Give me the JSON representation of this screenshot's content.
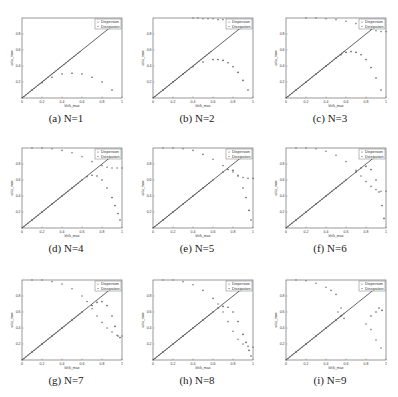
{
  "chart_data": [
    {
      "type": "scatter",
      "caption": "(a) N=1",
      "N": 1,
      "xlabel": "kh/k_max",
      "ylabel": "ω/ω_max",
      "xlim": [
        0,
        1
      ],
      "ylim": [
        0,
        1
      ],
      "xticks": [
        "0",
        "0.2",
        "0.4",
        "0.6",
        "0.8",
        "1"
      ],
      "yticks": [
        "0.2",
        "0.4",
        "0.6",
        "0.8"
      ],
      "legend": [
        "Dispersion",
        "Dissipation"
      ],
      "series": [
        {
          "name": "Exact",
          "x": [
            0,
            0.9
          ],
          "y": [
            0,
            0.9
          ]
        },
        {
          "name": "Dispersion",
          "x": [
            0.1,
            0.2,
            0.3,
            0.4,
            0.5,
            0.6,
            0.7,
            0.8,
            0.9
          ],
          "y": [
            0.1,
            0.19,
            0.26,
            0.3,
            0.31,
            0.3,
            0.26,
            0.2,
            0.1
          ]
        },
        {
          "name": "Dissipation",
          "x": [],
          "y": []
        }
      ]
    },
    {
      "type": "scatter",
      "caption": "(b) N=2",
      "N": 2,
      "xlabel": "kh/k_max",
      "ylabel": "ω/ω_max",
      "xlim": [
        0,
        1
      ],
      "ylim": [
        0,
        1
      ],
      "xticks": [
        "0",
        "0.2",
        "0.4",
        "0.6",
        "0.8",
        "1"
      ],
      "yticks": [
        "0.2",
        "0.4",
        "0.6",
        "0.8"
      ],
      "legend": [
        "Dispersion",
        "Dissipation"
      ],
      "series": [
        {
          "name": "Exact",
          "x": [
            0,
            0.9
          ],
          "y": [
            0,
            0.9
          ]
        },
        {
          "name": "Dispersion",
          "x": [
            0.1,
            0.2,
            0.3,
            0.4,
            0.5,
            0.6,
            0.65,
            0.7,
            0.75,
            0.8,
            0.85,
            0.9,
            0.95
          ],
          "y": [
            0.1,
            0.2,
            0.3,
            0.39,
            0.45,
            0.48,
            0.48,
            0.47,
            0.44,
            0.39,
            0.32,
            0.22,
            0.1
          ]
        },
        {
          "name": "Dissipation",
          "x": [
            0.4,
            0.45,
            0.5,
            0.55,
            0.6,
            0.65,
            0.7,
            0.75,
            0.8,
            0.85,
            0.9,
            0.95
          ],
          "y": [
            1,
            1,
            0.99,
            0.99,
            0.99,
            0.98,
            0.98,
            0.97,
            0.97,
            0.96,
            0.96,
            0.95
          ]
        }
      ]
    },
    {
      "type": "scatter",
      "caption": "(c) N=3",
      "N": 3,
      "xlabel": "kh/k_max",
      "ylabel": "ω/ω_max",
      "xlim": [
        0,
        1
      ],
      "ylim": [
        0,
        1
      ],
      "xticks": [
        "0",
        "0.2",
        "0.4",
        "0.6",
        "0.8",
        "1"
      ],
      "yticks": [
        "0.2",
        "0.4",
        "0.6",
        "0.8"
      ],
      "legend": [
        "Dispersion",
        "Dissipation"
      ],
      "series": [
        {
          "name": "Exact",
          "x": [
            0,
            0.9
          ],
          "y": [
            0,
            0.9
          ]
        },
        {
          "name": "Dispersion",
          "x": [
            0.1,
            0.2,
            0.3,
            0.4,
            0.5,
            0.55,
            0.6,
            0.65,
            0.7,
            0.75,
            0.8,
            0.85,
            0.9,
            0.95
          ],
          "y": [
            0.1,
            0.2,
            0.3,
            0.4,
            0.5,
            0.54,
            0.57,
            0.58,
            0.57,
            0.54,
            0.48,
            0.38,
            0.25,
            0.1
          ]
        },
        {
          "name": "Dissipation",
          "x": [
            0.2,
            0.3,
            0.4,
            0.5,
            0.6,
            0.7,
            0.75,
            0.8,
            0.85,
            0.9,
            0.95,
            1.0
          ],
          "y": [
            1,
            1,
            0.99,
            0.98,
            0.96,
            0.93,
            0.91,
            0.89,
            0.86,
            0.84,
            0.83,
            0.83
          ]
        }
      ]
    },
    {
      "type": "scatter",
      "caption": "(d) N=4",
      "N": 4,
      "xlabel": "kh/k_max",
      "ylabel": "ω/ω_max",
      "xlim": [
        0,
        1
      ],
      "ylim": [
        0,
        1
      ],
      "xticks": [
        "0",
        "0.2",
        "0.4",
        "0.6",
        "0.8",
        "1"
      ],
      "yticks": [
        "0.2",
        "0.4",
        "0.6",
        "0.8"
      ],
      "legend": [
        "Dispersion",
        "Dissipation"
      ],
      "series": [
        {
          "name": "Exact",
          "x": [
            0,
            0.9
          ],
          "y": [
            0,
            0.9
          ]
        },
        {
          "name": "Dispersion",
          "x": [
            0.1,
            0.2,
            0.3,
            0.4,
            0.5,
            0.6,
            0.65,
            0.7,
            0.75,
            0.8,
            0.85,
            0.9,
            0.93,
            0.96,
            0.98
          ],
          "y": [
            0.1,
            0.2,
            0.3,
            0.4,
            0.5,
            0.6,
            0.64,
            0.66,
            0.65,
            0.6,
            0.5,
            0.38,
            0.28,
            0.18,
            0.1
          ]
        },
        {
          "name": "Dissipation",
          "x": [
            0.1,
            0.2,
            0.3,
            0.4,
            0.5,
            0.6,
            0.7,
            0.8,
            0.85,
            0.9,
            0.95,
            1.0
          ],
          "y": [
            1,
            1,
            0.99,
            0.97,
            0.94,
            0.89,
            0.83,
            0.78,
            0.76,
            0.75,
            0.75,
            0.75
          ]
        }
      ]
    },
    {
      "type": "scatter",
      "caption": "(e) N=5",
      "N": 5,
      "xlabel": "kh/k_max",
      "ylabel": "ω/ω_max",
      "xlim": [
        0,
        1
      ],
      "ylim": [
        0,
        1
      ],
      "xticks": [
        "0",
        "0.2",
        "0.4",
        "0.6",
        "0.8",
        "1"
      ],
      "yticks": [
        "0.2",
        "0.4",
        "0.6",
        "0.8"
      ],
      "legend": [
        "Dispersion",
        "Dissipation"
      ],
      "series": [
        {
          "name": "Exact",
          "x": [
            0,
            0.9
          ],
          "y": [
            0,
            0.9
          ]
        },
        {
          "name": "Dispersion",
          "x": [
            0.1,
            0.2,
            0.3,
            0.4,
            0.5,
            0.6,
            0.7,
            0.75,
            0.8,
            0.85,
            0.9,
            0.93,
            0.96,
            0.98
          ],
          "y": [
            0.1,
            0.2,
            0.3,
            0.4,
            0.5,
            0.6,
            0.7,
            0.73,
            0.72,
            0.65,
            0.5,
            0.38,
            0.22,
            0.1
          ]
        },
        {
          "name": "Dissipation",
          "x": [
            0.1,
            0.2,
            0.3,
            0.4,
            0.5,
            0.6,
            0.7,
            0.8,
            0.85,
            0.9,
            0.95,
            1.0
          ],
          "y": [
            1,
            1,
            0.99,
            0.97,
            0.92,
            0.86,
            0.78,
            0.7,
            0.66,
            0.63,
            0.62,
            0.62
          ]
        }
      ]
    },
    {
      "type": "scatter",
      "caption": "(f) N=6",
      "N": 6,
      "xlabel": "kh/k_max",
      "ylabel": "ω/ω_max",
      "xlim": [
        0,
        1
      ],
      "ylim": [
        0,
        1
      ],
      "xticks": [
        "0",
        "0.2",
        "0.4",
        "0.6",
        "0.8",
        "1"
      ],
      "yticks": [
        "0.2",
        "0.4",
        "0.6",
        "0.8"
      ],
      "legend": [
        "Dispersion",
        "Dissipation"
      ],
      "series": [
        {
          "name": "Exact",
          "x": [
            0,
            0.9
          ],
          "y": [
            0,
            0.9
          ]
        },
        {
          "name": "Dispersion",
          "x": [
            0.1,
            0.2,
            0.3,
            0.4,
            0.5,
            0.6,
            0.7,
            0.75,
            0.8,
            0.85,
            0.9,
            0.93,
            0.96,
            0.98
          ],
          "y": [
            0.1,
            0.2,
            0.3,
            0.4,
            0.5,
            0.6,
            0.7,
            0.75,
            0.77,
            0.73,
            0.6,
            0.45,
            0.28,
            0.12
          ]
        },
        {
          "name": "Dissipation",
          "x": [
            0.1,
            0.2,
            0.3,
            0.4,
            0.5,
            0.6,
            0.7,
            0.75,
            0.8,
            0.85,
            0.9,
            0.95,
            1.0
          ],
          "y": [
            1,
            1,
            0.99,
            0.96,
            0.91,
            0.83,
            0.72,
            0.65,
            0.58,
            0.52,
            0.48,
            0.46,
            0.46
          ]
        }
      ]
    },
    {
      "type": "scatter",
      "caption": "(g) N=7",
      "N": 7,
      "xlabel": "kh/k_max",
      "ylabel": "ω/ω_max",
      "xlim": [
        0,
        1
      ],
      "ylim": [
        0,
        1
      ],
      "xticks": [
        "0",
        "0.2",
        "0.4",
        "0.6",
        "0.8",
        "1"
      ],
      "yticks": [
        "0.2",
        "0.4",
        "0.6",
        "0.8"
      ],
      "legend": [
        "Dispersion",
        "Dissipation"
      ],
      "series": [
        {
          "name": "Exact",
          "x": [
            0,
            0.9
          ],
          "y": [
            0,
            0.9
          ]
        },
        {
          "name": "Dispersion",
          "x": [
            0.1,
            0.2,
            0.3,
            0.4,
            0.5,
            0.6,
            0.7,
            0.75,
            0.8,
            0.85,
            0.9,
            0.93,
            0.96,
            0.98
          ],
          "y": [
            0.1,
            0.2,
            0.3,
            0.4,
            0.5,
            0.6,
            0.68,
            0.72,
            0.73,
            0.68,
            0.55,
            0.42,
            0.3,
            0.28
          ]
        },
        {
          "name": "Dissipation",
          "x": [
            0.1,
            0.2,
            0.3,
            0.4,
            0.5,
            0.6,
            0.65,
            0.7,
            0.75,
            0.8,
            0.85,
            0.9,
            0.95,
            1.0
          ],
          "y": [
            1,
            1,
            0.98,
            0.95,
            0.89,
            0.8,
            0.73,
            0.64,
            0.55,
            0.47,
            0.4,
            0.35,
            0.31,
            0.3
          ]
        }
      ]
    },
    {
      "type": "scatter",
      "caption": "(h) N=8",
      "N": 8,
      "xlabel": "kh/k_max",
      "ylabel": "ω/ω_max",
      "xlim": [
        0,
        1
      ],
      "ylim": [
        0,
        1
      ],
      "xticks": [
        "0",
        "0.2",
        "0.4",
        "0.6",
        "0.8",
        "1"
      ],
      "yticks": [
        "0.2",
        "0.4",
        "0.6",
        "0.8"
      ],
      "legend": [
        "Dispersion",
        "Dissipation"
      ],
      "series": [
        {
          "name": "Exact",
          "x": [
            0,
            0.9
          ],
          "y": [
            0,
            0.9
          ]
        },
        {
          "name": "Dispersion",
          "x": [
            0.1,
            0.2,
            0.3,
            0.4,
            0.5,
            0.6,
            0.65,
            0.7,
            0.75,
            0.8,
            0.85,
            0.9,
            0.93,
            0.96,
            0.98
          ],
          "y": [
            0.1,
            0.2,
            0.3,
            0.4,
            0.5,
            0.6,
            0.65,
            0.67,
            0.66,
            0.6,
            0.48,
            0.32,
            0.22,
            0.12,
            0.05
          ]
        },
        {
          "name": "Dissipation",
          "x": [
            0.1,
            0.2,
            0.3,
            0.4,
            0.5,
            0.6,
            0.65,
            0.7,
            0.75,
            0.8,
            0.85,
            0.9,
            0.95,
            1.0
          ],
          "y": [
            1,
            1,
            0.98,
            0.94,
            0.87,
            0.77,
            0.7,
            0.6,
            0.48,
            0.36,
            0.26,
            0.2,
            0.17,
            0.16
          ]
        }
      ]
    },
    {
      "type": "scatter",
      "caption": "(i) N=9",
      "N": 9,
      "xlabel": "kh/k_max",
      "ylabel": "ω/ω_max",
      "xlim": [
        0,
        1
      ],
      "ylim": [
        0,
        1
      ],
      "xticks": [
        "0",
        "0.2",
        "0.4",
        "0.6",
        "0.8",
        "1"
      ],
      "yticks": [
        "0.2",
        "0.4",
        "0.6",
        "0.8"
      ],
      "legend": [
        "Dispersion",
        "Dissipation"
      ],
      "series": [
        {
          "name": "Exact",
          "x": [
            0,
            0.9
          ],
          "y": [
            0,
            0.9
          ]
        },
        {
          "name": "Dispersion",
          "x": [
            0.1,
            0.2,
            0.3,
            0.4,
            0.5,
            0.55,
            0.85,
            0.9,
            0.93,
            0.96
          ],
          "y": [
            0.1,
            0.2,
            0.3,
            0.4,
            0.5,
            0.55,
            0.55,
            0.6,
            0.65,
            0.62
          ]
        },
        {
          "name": "Dissipation",
          "x": [
            0.1,
            0.2,
            0.3,
            0.4,
            0.45,
            0.5,
            0.52,
            0.55,
            0.58,
            0.8,
            0.85,
            0.9,
            0.95
          ],
          "y": [
            1,
            0.99,
            0.96,
            0.91,
            0.87,
            0.82,
            0.6,
            0.65,
            0.52,
            0.45,
            0.38,
            0.25,
            0.15
          ]
        }
      ]
    }
  ]
}
